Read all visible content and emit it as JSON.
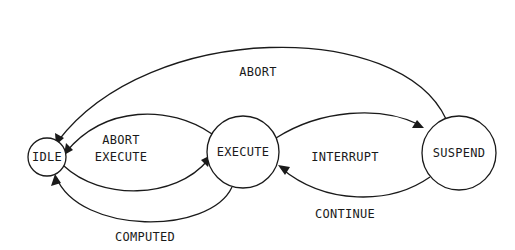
{
  "diagram": {
    "type": "state-transition",
    "states": [
      {
        "id": "idle",
        "label": "IDLE"
      },
      {
        "id": "execute",
        "label": "EXECUTE"
      },
      {
        "id": "suspend",
        "label": "SUSPEND"
      }
    ],
    "transitions": [
      {
        "from": "suspend",
        "to": "idle",
        "label": "ABORT"
      },
      {
        "from": "execute",
        "to": "idle",
        "label_line1": "ABORT",
        "label_line2": "EXECUTE",
        "note": "upper arc toward IDLE"
      },
      {
        "from": "idle",
        "to": "execute",
        "label": "EXECUTE",
        "note": "lower arc toward EXECUTE (shares stacked label)"
      },
      {
        "from": "execute",
        "to": "suspend",
        "label": "INTERRUPT"
      },
      {
        "from": "suspend",
        "to": "execute",
        "label": "CONTINUE"
      },
      {
        "from": "execute",
        "to": "idle",
        "label": "COMPUTED"
      }
    ],
    "labels": {
      "abort_top": "ABORT",
      "abort_mid": "ABORT",
      "execute_mid": "EXECUTE",
      "interrupt": "INTERRUPT",
      "continue": "CONTINUE",
      "computed": "COMPUTED"
    }
  }
}
